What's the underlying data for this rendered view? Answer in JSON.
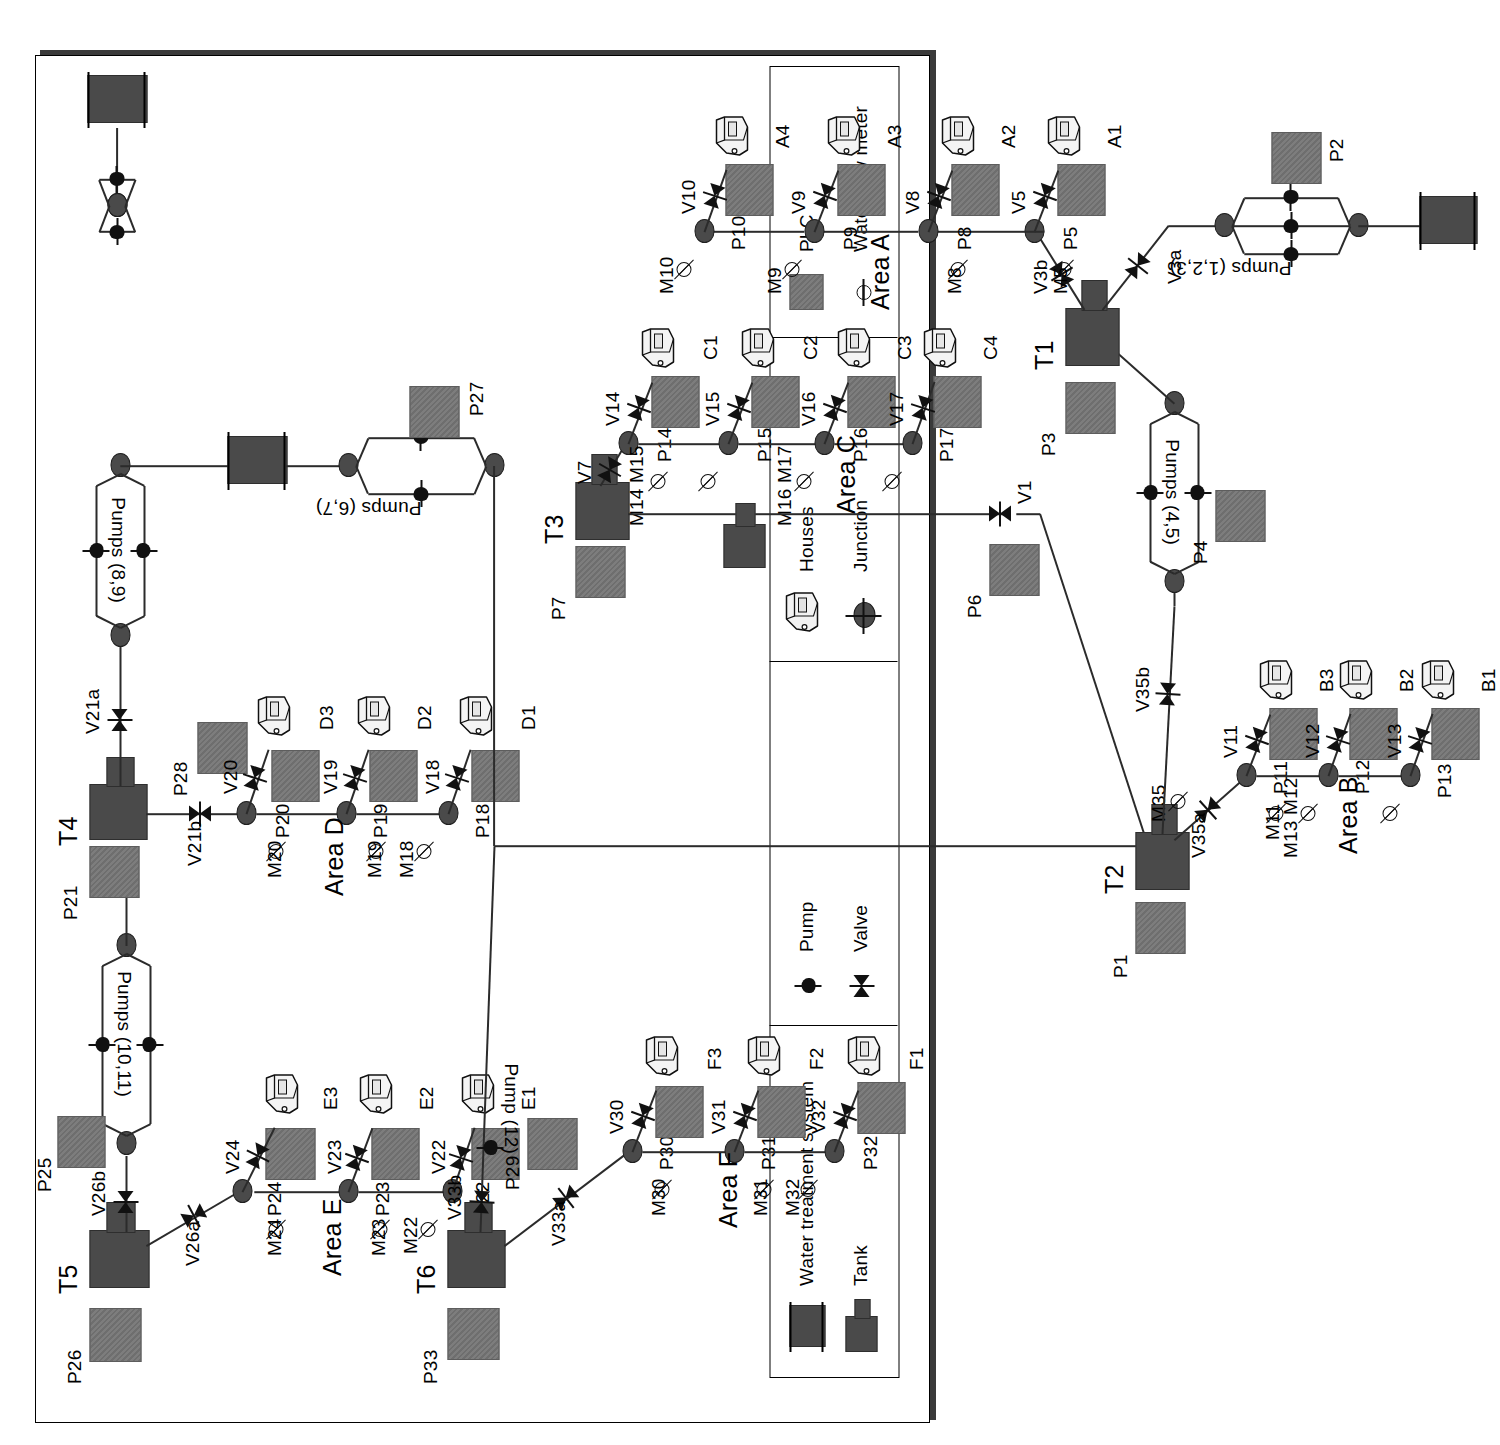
{
  "diagram": {
    "orientation": "landscape-rotated-90ccw"
  },
  "legend": {
    "items": [
      {
        "key": "wts",
        "label": "Water treatment system",
        "icon": "water-treatment-system-icon"
      },
      {
        "key": "tank",
        "label": "Tank",
        "icon": "tank-icon"
      },
      {
        "key": "pump",
        "label": "Pump",
        "icon": "pump-icon"
      },
      {
        "key": "valve",
        "label": "Valve",
        "icon": "valve-icon"
      },
      {
        "key": "houses",
        "label": "Houses",
        "icon": "houses-icon"
      },
      {
        "key": "junction",
        "label": "Junction",
        "icon": "junction-icon"
      },
      {
        "key": "plc",
        "label": "PLC",
        "icon": "plc-icon"
      },
      {
        "key": "meter",
        "label": "Water flow meter",
        "icon": "water-flow-meter-icon"
      }
    ]
  },
  "areas": [
    {
      "id": "A",
      "label": "Area A"
    },
    {
      "id": "B",
      "label": "Area B"
    },
    {
      "id": "C",
      "label": "Area C"
    },
    {
      "id": "D",
      "label": "Area D"
    },
    {
      "id": "E",
      "label": "Area E"
    },
    {
      "id": "F",
      "label": "Area F"
    }
  ],
  "tanks": [
    {
      "id": "T1"
    },
    {
      "id": "T2"
    },
    {
      "id": "T3"
    },
    {
      "id": "T4"
    },
    {
      "id": "T5"
    },
    {
      "id": "T6"
    },
    {
      "id": "Tu1"
    },
    {
      "id": "Tu2"
    }
  ],
  "tank_labels": [
    "T1",
    "T2",
    "T3",
    "T4",
    "T5",
    "T6"
  ],
  "plcs": [
    "P1",
    "P2",
    "P3",
    "P4",
    "P5",
    "P6",
    "P7",
    "P8",
    "P9",
    "P10",
    "P11",
    "P12",
    "P13",
    "P14",
    "P15",
    "P16",
    "P17",
    "P18",
    "P19",
    "P20",
    "P21",
    "P22",
    "P23",
    "P24",
    "P25",
    "P26",
    "P27",
    "P28",
    "P29",
    "P30",
    "P31",
    "P32",
    "P33"
  ],
  "valves": [
    "V1",
    "V3a",
    "V3b",
    "V5",
    "V7",
    "V8",
    "V9",
    "V10",
    "V11",
    "V12",
    "V13",
    "V14",
    "V15",
    "V16",
    "V17",
    "V18",
    "V19",
    "V20",
    "V21a",
    "V21b",
    "V22",
    "V23",
    "V24",
    "V26a",
    "V26b",
    "V30",
    "V31",
    "V32",
    "V33a",
    "V33b",
    "V35a",
    "V35b"
  ],
  "meters": [
    "M5",
    "M8",
    "M9",
    "M10",
    "M11",
    "M12",
    "M13",
    "M14",
    "M15",
    "M16",
    "M17",
    "M18",
    "M19",
    "M20",
    "M22",
    "M23",
    "M24",
    "M30",
    "M31",
    "M32",
    "M35"
  ],
  "pump_groups": [
    {
      "label": "Pumps (1,2,3)",
      "count": 3
    },
    {
      "label": "Pumps (4,5)",
      "count": 2
    },
    {
      "label": "Pumps (6,7)",
      "count": 2
    },
    {
      "label": "Pumps (8,9)",
      "count": 2
    },
    {
      "label": "Pumps (10,11)",
      "count": 2
    },
    {
      "label": "Pump (12)",
      "count": 1
    }
  ],
  "houses": [
    {
      "id": "A1"
    },
    {
      "id": "A2"
    },
    {
      "id": "A3"
    },
    {
      "id": "A4"
    },
    {
      "id": "B1"
    },
    {
      "id": "B2"
    },
    {
      "id": "B3"
    },
    {
      "id": "C1"
    },
    {
      "id": "C2"
    },
    {
      "id": "C3"
    },
    {
      "id": "C4"
    },
    {
      "id": "D1"
    },
    {
      "id": "D2"
    },
    {
      "id": "D3"
    },
    {
      "id": "E1"
    },
    {
      "id": "E2"
    },
    {
      "id": "E3"
    },
    {
      "id": "F1"
    },
    {
      "id": "F2"
    },
    {
      "id": "F3"
    }
  ],
  "colors": {
    "tank_fill": "#4a4a4a",
    "plc_fill": "#747474",
    "junction_fill": "#4a4a4a",
    "line": "#2b2b2b",
    "frame": "#3a3a3a",
    "background": "#ffffff"
  }
}
